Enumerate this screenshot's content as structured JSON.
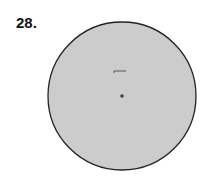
{
  "problem": {
    "number": "28."
  },
  "figure": {
    "shape": "circle",
    "fill": "#cccccc",
    "stroke": "#222222",
    "center_dot": true
  }
}
